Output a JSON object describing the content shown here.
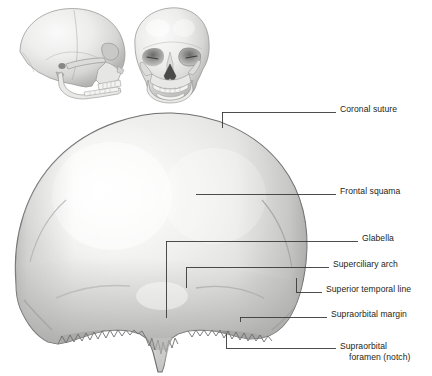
{
  "figure": {
    "background_color": "#ffffff",
    "label_color": "#231f20",
    "leader_color": "#3a3a3a",
    "bone_light": "#f4f4f3",
    "bone_mid": "#d9d9d7",
    "bone_dark": "#a8a8a6",
    "outline_color": "#6e6e6e"
  },
  "thumbnails": [
    {
      "name": "lateral-skull-thumbnail",
      "caption": ""
    },
    {
      "name": "anterior-skull-thumbnail",
      "caption": ""
    }
  ],
  "labels": [
    {
      "id": "coronal-suture",
      "text": "Coronal suture",
      "text2": "",
      "x": 340,
      "y": 109
    },
    {
      "id": "frontal-squama",
      "text": "Frontal squama",
      "text2": "",
      "x": 340,
      "y": 191
    },
    {
      "id": "glabella",
      "text": "Glabella",
      "text2": "",
      "x": 362,
      "y": 237
    },
    {
      "id": "superciliary-arch",
      "text": "Superciliary arch",
      "text2": "",
      "x": 333,
      "y": 264
    },
    {
      "id": "superior-temporal-line",
      "text": "Superior temporal line",
      "text2": "",
      "x": 326,
      "y": 289
    },
    {
      "id": "supraorbital-margin",
      "text": "Supraorbital margin",
      "text2": "",
      "x": 331,
      "y": 314
    },
    {
      "id": "supraorbital-foramen",
      "text": "Supraorbital",
      "text2": "foramen (notch)",
      "x": 340,
      "y": 340
    }
  ]
}
